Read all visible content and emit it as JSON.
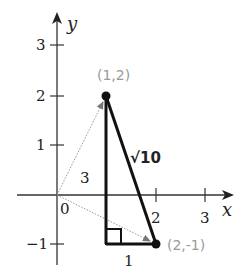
{
  "diagram": {
    "type": "coordinate-plane-right-triangle",
    "axes": {
      "x_label": "x",
      "y_label": "y",
      "x_ticks": [
        "0",
        "1",
        "2",
        "3"
      ],
      "y_ticks": [
        "-1",
        "1",
        "2",
        "3"
      ],
      "origin_label": "0"
    },
    "tick_labels": {
      "x2": "2",
      "x3": "3",
      "y3": "3",
      "y2": "2",
      "y1": "1",
      "ym1": "−1",
      "origin": "0"
    },
    "points": [
      {
        "label": "(1,2)",
        "x": 1,
        "y": 2
      },
      {
        "label": "(2,-1)",
        "x": 2,
        "y": -1
      }
    ],
    "side_labels": {
      "vertical": "3",
      "horizontal": "1",
      "hypotenuse": "√10"
    },
    "colors": {
      "triangle": "#111111",
      "axes": "#333333",
      "vectors": "#9a9a9a",
      "point_labels": "#9a9a9a"
    }
  }
}
